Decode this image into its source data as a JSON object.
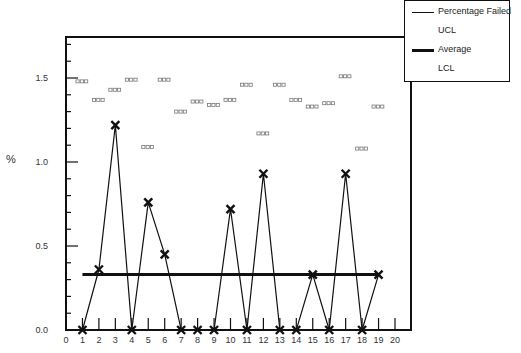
{
  "chart_data": {
    "type": "line",
    "title": "",
    "xlabel": "",
    "ylabel": "%",
    "xlim": [
      0,
      20
    ],
    "ylim": [
      0,
      1.75
    ],
    "x_ticks": [
      0,
      1,
      2,
      3,
      4,
      5,
      6,
      7,
      8,
      9,
      10,
      11,
      12,
      13,
      14,
      15,
      16,
      17,
      18,
      19,
      20
    ],
    "y_ticks": [
      0.0,
      0.5,
      1.0,
      1.5
    ],
    "y_tick_labels": [
      "0.0",
      "0.5",
      "1.0",
      "1.5"
    ],
    "grid": false,
    "legend_position": "top-right",
    "x": [
      1,
      2,
      3,
      4,
      5,
      6,
      7,
      8,
      9,
      10,
      11,
      12,
      13,
      14,
      15,
      16,
      17,
      18,
      19
    ],
    "series": [
      {
        "name": "Percentage Failed",
        "style": "thin-line-x-markers",
        "values": [
          0,
          0.36,
          1.22,
          0,
          0.76,
          0.45,
          0,
          0,
          0,
          0.72,
          0,
          0.93,
          0,
          0,
          0.33,
          0,
          0.93,
          0,
          0.33
        ]
      },
      {
        "name": "UCL",
        "style": "dash-markers",
        "values": [
          1.48,
          1.37,
          1.43,
          1.49,
          1.09,
          1.49,
          1.3,
          1.36,
          1.34,
          1.37,
          1.46,
          1.17,
          1.46,
          1.37,
          1.33,
          1.35,
          1.51,
          1.08,
          1.33
        ]
      },
      {
        "name": "Average",
        "style": "thick-line",
        "values": [
          0.33,
          0.33,
          0.33,
          0.33,
          0.33,
          0.33,
          0.33,
          0.33,
          0.33,
          0.33,
          0.33,
          0.33,
          0.33,
          0.33,
          0.33,
          0.33,
          0.33,
          0.33,
          0.33
        ]
      },
      {
        "name": "LCL",
        "style": "dash-markers",
        "values": [
          0,
          0,
          0,
          0,
          0,
          0,
          0,
          0,
          0,
          0,
          0,
          0,
          0,
          0,
          0,
          0,
          0,
          0,
          0
        ]
      }
    ]
  },
  "legend": {
    "items": [
      {
        "label": "Percentage Failed",
        "swatch": "thin"
      },
      {
        "label": "UCL",
        "swatch": "none"
      },
      {
        "label": "Average",
        "swatch": "thick"
      },
      {
        "label": "LCL",
        "swatch": "none"
      }
    ]
  },
  "axis": {
    "ylabel": "%"
  },
  "colors": {
    "line": "#111111",
    "ucl_marker": "#777777",
    "axis": "#111111"
  }
}
